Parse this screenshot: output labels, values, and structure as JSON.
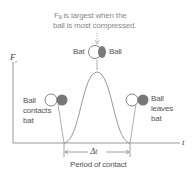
{
  "annotation": {
    "line1": "Fₐ is largest when the",
    "line2": "ball is most compressed."
  },
  "axes": {
    "y_label": "F",
    "y_subscript": "r",
    "x_label": "t"
  },
  "peak": {
    "left_label": "Bat",
    "right_label": "Ball"
  },
  "contact": {
    "line1": "Ball",
    "line2": "contacts",
    "line3": "bat"
  },
  "leave": {
    "line1": "Ball",
    "line2": "leaves",
    "line3": "bat"
  },
  "interval": {
    "symbol": "Δt",
    "label": "Period of contact"
  },
  "colors": {
    "line": "#9a9a9a",
    "ball": "#777777",
    "text": "#555555",
    "caption": "#8a8a8a"
  }
}
